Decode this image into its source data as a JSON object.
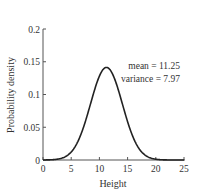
{
  "chart_data": {
    "type": "line",
    "title": "",
    "xlabel": "Height",
    "ylabel": "Probability density",
    "xlim": [
      0,
      25
    ],
    "ylim": [
      0,
      0.2
    ],
    "xticks": [
      "0",
      "5",
      "10",
      "15",
      "20",
      "25"
    ],
    "yticks": [
      "0",
      "0.05",
      "0.1",
      "0.15",
      "0.2"
    ],
    "grid": false,
    "legend": null,
    "annotations": [
      "mean = 11.25",
      "variance = 7.97"
    ],
    "series": [
      {
        "name": "Normal PDF",
        "mean": 11.25,
        "variance": 7.97,
        "x": [
          0,
          2,
          4,
          5,
          6,
          7,
          8,
          9,
          10,
          11,
          11.25,
          12,
          13,
          14,
          15,
          16,
          17,
          18,
          20,
          22,
          25
        ],
        "values": [
          0.0005,
          0.0065,
          0.0052,
          0.012,
          0.0249,
          0.044,
          0.0725,
          0.1021,
          0.1275,
          0.1407,
          0.1413,
          0.1367,
          0.1163,
          0.088,
          0.0589,
          0.0345,
          0.0178,
          0.0082,
          0.0011,
          0.0001,
          0.0
        ]
      }
    ]
  },
  "labels": {
    "xlabel": "Height",
    "ylabel": "Probability density",
    "annotation_mean": "mean = 11.25",
    "annotation_variance": "variance = 7.97"
  }
}
